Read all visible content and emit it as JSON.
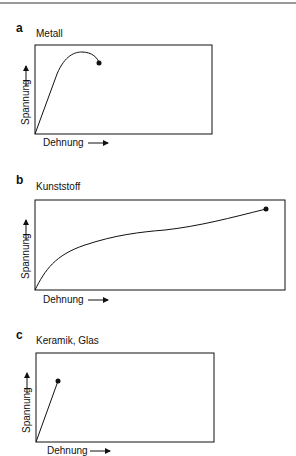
{
  "panels": [
    {
      "letter": "a",
      "title": "Metall",
      "xlabel": "Dehnung",
      "ylabel": "Spannung"
    },
    {
      "letter": "b",
      "title": "Kunststoff",
      "xlabel": "Dehnung",
      "ylabel": "Spannung"
    },
    {
      "letter": "c",
      "title": "Keramik, Glas",
      "xlabel": "Dehnung",
      "ylabel": "Spannung"
    }
  ],
  "colors": {
    "line": "#111111",
    "frame": "#111111",
    "topline": "#9a9a9a"
  }
}
